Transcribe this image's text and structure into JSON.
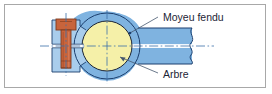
{
  "figure": {
    "frame_color": "#a8a8a8",
    "background_color": "#ffffff"
  },
  "labels": {
    "hub": "Moyeu fendu",
    "shaft": "Arbre"
  },
  "colors": {
    "hub_blue": "#7fb3e0",
    "hub_blue_light": "#a9cdec",
    "hub_blue_dark": "#5f93c4",
    "shaft_yellow": "#f5f0a8",
    "bolt_orange": "#c8643c",
    "bolt_orange_dark": "#a04a28",
    "outline": "#1c3f6e",
    "centerline": "#3a6ea8",
    "leader": "#46586e",
    "text": "#1c2536"
  },
  "parts": [
    {
      "id": "hub",
      "name": "Moyeu fendu",
      "section": true,
      "color": "#7fb3e0"
    },
    {
      "id": "shaft",
      "name": "Arbre",
      "section": true,
      "color": "#f5f0a8"
    },
    {
      "id": "bolt",
      "name": "Vis de serrage",
      "section": true,
      "color": "#c8643c"
    }
  ],
  "geometry": {
    "shaft_center_x": 107,
    "shaft_center_y": 46,
    "shaft_radius": 25,
    "hub_bore_radius": 33,
    "bolt_axis_x": 66,
    "slot_y": 46,
    "arm_right_end_x": 192
  }
}
